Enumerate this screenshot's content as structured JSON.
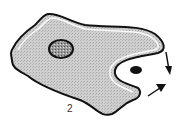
{
  "diagram": {
    "step_label": "2",
    "elements": [
      {
        "name": "cell-body",
        "description": "Amoeboid cell with stippled cytoplasm"
      },
      {
        "name": "nucleus",
        "description": "Oval stippled nucleus with dark outline"
      },
      {
        "name": "particle",
        "description": "Dark oval particle being engulfed"
      },
      {
        "name": "pseudopod-arrows",
        "description": "Two arrows showing pseudopods closing around particle"
      }
    ],
    "colors": {
      "outline": "#111111",
      "cytoplasm": "#c8c8c8",
      "halo": "#ffffff",
      "background": "#ffffff"
    }
  }
}
